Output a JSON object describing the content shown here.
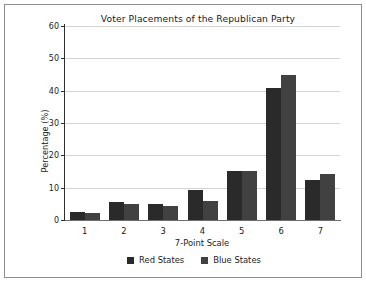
{
  "figure": {
    "border_color": "#8d8d8d",
    "background": "#ffffff"
  },
  "chart_data": {
    "type": "bar",
    "title": "Voter Placements of the Republican Party",
    "xlabel": "7-Point Scale",
    "ylabel": "Percentage (%)",
    "categories": [
      "1",
      "2",
      "3",
      "4",
      "5",
      "6",
      "7"
    ],
    "ylim": [
      0,
      60
    ],
    "yticks": [
      0,
      10,
      20,
      30,
      40,
      50,
      60
    ],
    "ytick_labels": [
      "0",
      "10",
      "20",
      "30",
      "40",
      "50",
      "60"
    ],
    "grid": true,
    "grid_axis": "y",
    "legend_position": "bottom",
    "series": [
      {
        "name": "Red States",
        "color": "#2a2a2a",
        "values": [
          2.5,
          5.6,
          4.8,
          9.2,
          15.1,
          40.7,
          12.3
        ]
      },
      {
        "name": "Blue States",
        "color": "#414141",
        "values": [
          2.1,
          4.9,
          4.4,
          6.0,
          15.3,
          45.0,
          14.3
        ]
      }
    ]
  }
}
